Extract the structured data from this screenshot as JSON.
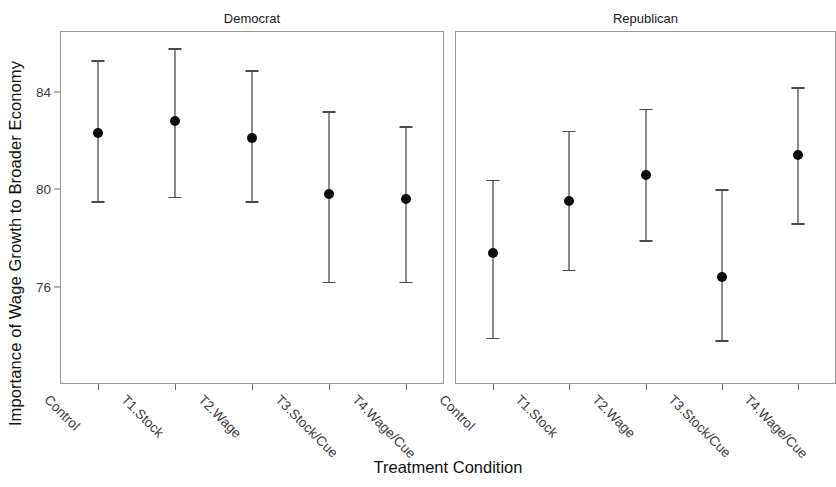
{
  "chart_data": {
    "type": "scatter",
    "title": "",
    "xlabel": "Treatment Condition",
    "ylabel": "Importance of Wage Growth to Broader Economy",
    "categories": [
      "Control",
      "T1.Stock",
      "T2.Wage",
      "T3.Stock/Cue",
      "T4.Wage/Cue"
    ],
    "ytick_labels": [
      "84",
      "80",
      "76"
    ],
    "ytick_values": [
      84,
      80,
      76
    ],
    "ylim": [
      72.0,
      86.5
    ],
    "grid": false,
    "legend": false,
    "facets": [
      {
        "label": "Democrat",
        "points": [
          {
            "category": "Control",
            "estimate": 82.3,
            "low": 79.5,
            "high": 85.3
          },
          {
            "category": "T1.Stock",
            "estimate": 82.8,
            "low": 79.7,
            "high": 85.8
          },
          {
            "category": "T2.Wage",
            "estimate": 82.1,
            "low": 79.5,
            "high": 84.9
          },
          {
            "category": "T3.Stock/Cue",
            "estimate": 79.8,
            "low": 76.2,
            "high": 83.2
          },
          {
            "category": "T4.Wage/Cue",
            "estimate": 79.6,
            "low": 76.2,
            "high": 82.6
          }
        ]
      },
      {
        "label": "Republican",
        "points": [
          {
            "category": "Control",
            "estimate": 77.4,
            "low": 73.9,
            "high": 80.4
          },
          {
            "category": "T1.Stock",
            "estimate": 79.5,
            "low": 76.7,
            "high": 82.4
          },
          {
            "category": "T2.Wage",
            "estimate": 80.6,
            "low": 77.9,
            "high": 83.3
          },
          {
            "category": "T3.Stock/Cue",
            "estimate": 76.4,
            "low": 73.8,
            "high": 80.0
          },
          {
            "category": "T4.Wage/Cue",
            "estimate": 81.4,
            "low": 78.6,
            "high": 84.2
          }
        ]
      }
    ]
  },
  "axis": {
    "y_title": "Importance of Wage Growth to Broader Economy",
    "x_title": "Treatment Condition"
  },
  "colors": {
    "point": "#0d0d0d",
    "bar": "#1b1b1b",
    "cap": "#4a4a4a",
    "panel_border": "#9a9a9a",
    "tick": "#6b6b6b",
    "tick_label": "#3a3a3a",
    "background": "#ffffff"
  }
}
